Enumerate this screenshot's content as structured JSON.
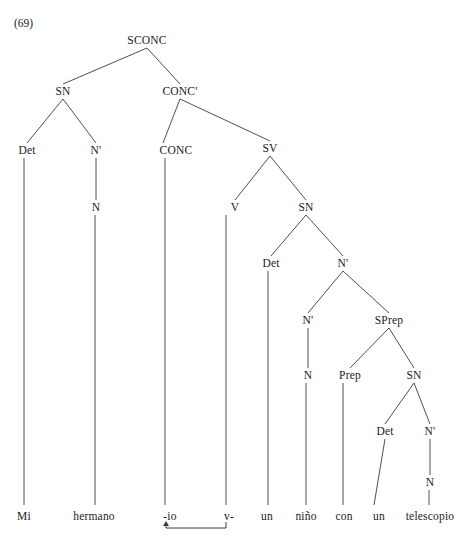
{
  "figure": {
    "example_number": "(69)",
    "type": "syntax-tree",
    "language": "Spanish",
    "sentence": "Mi hermano -io v- un niño con un telescopio",
    "line_color": "#3a3a4a",
    "text_color": "#1a1a1a",
    "background_color": "#ffffff",
    "width": 465,
    "height": 544
  },
  "nodes": [
    {
      "id": "sconc",
      "label": "SCONC",
      "x": 147,
      "y": 40
    },
    {
      "id": "sn1",
      "label": "SN",
      "x": 63,
      "y": 91
    },
    {
      "id": "conc_bar",
      "label": "CONC'",
      "x": 180,
      "y": 91
    },
    {
      "id": "det1",
      "label": "Det",
      "x": 27,
      "y": 150
    },
    {
      "id": "nbar1",
      "label": "N'",
      "x": 96,
      "y": 150
    },
    {
      "id": "conc",
      "label": "CONC",
      "x": 176,
      "y": 150
    },
    {
      "id": "sv",
      "label": "SV",
      "x": 270,
      "y": 148
    },
    {
      "id": "n1",
      "label": "N",
      "x": 96,
      "y": 207
    },
    {
      "id": "v",
      "label": "V",
      "x": 235,
      "y": 207
    },
    {
      "id": "sn2",
      "label": "SN",
      "x": 306,
      "y": 207
    },
    {
      "id": "det2",
      "label": "Det",
      "x": 271,
      "y": 263
    },
    {
      "id": "nbar2",
      "label": "N'",
      "x": 343,
      "y": 263
    },
    {
      "id": "nbar3",
      "label": "N'",
      "x": 308,
      "y": 320
    },
    {
      "id": "sprep",
      "label": "SPrep",
      "x": 389,
      "y": 320
    },
    {
      "id": "n2",
      "label": "N",
      "x": 308,
      "y": 375
    },
    {
      "id": "prep",
      "label": "Prep",
      "x": 350,
      "y": 375
    },
    {
      "id": "sn3",
      "label": "SN",
      "x": 414,
      "y": 375
    },
    {
      "id": "det3",
      "label": "Det",
      "x": 385,
      "y": 431
    },
    {
      "id": "nbar4",
      "label": "N'",
      "x": 430,
      "y": 431
    },
    {
      "id": "n3",
      "label": "N",
      "x": 430,
      "y": 482
    }
  ],
  "terminals": [
    {
      "id": "t_mi",
      "label": "Mi",
      "x": 24,
      "y": 516
    },
    {
      "id": "t_hermano",
      "label": "hermano",
      "x": 94,
      "y": 516
    },
    {
      "id": "t_io",
      "label": "-io",
      "x": 170,
      "y": 516
    },
    {
      "id": "t_v",
      "label": "v-",
      "x": 229,
      "y": 516
    },
    {
      "id": "t_un1",
      "label": "un",
      "x": 267,
      "y": 516
    },
    {
      "id": "t_nino",
      "label": "niño",
      "x": 306,
      "y": 516
    },
    {
      "id": "t_con",
      "label": "con",
      "x": 344,
      "y": 516
    },
    {
      "id": "t_un2",
      "label": "un",
      "x": 379,
      "y": 516
    },
    {
      "id": "t_telescopio",
      "label": "telescopio",
      "x": 430,
      "y": 516
    }
  ],
  "edges": [
    {
      "from": "sconc",
      "to": "sn1",
      "x1": 147,
      "y1": 48,
      "x2": 63,
      "y2": 84
    },
    {
      "from": "sconc",
      "to": "conc_bar",
      "x1": 147,
      "y1": 48,
      "x2": 180,
      "y2": 84
    },
    {
      "from": "sn1",
      "to": "det1",
      "x1": 63,
      "y1": 99,
      "x2": 27,
      "y2": 143
    },
    {
      "from": "sn1",
      "to": "nbar1",
      "x1": 63,
      "y1": 99,
      "x2": 96,
      "y2": 143
    },
    {
      "from": "conc_bar",
      "to": "conc",
      "x1": 180,
      "y1": 99,
      "x2": 163,
      "y2": 143
    },
    {
      "from": "conc_bar",
      "to": "sv",
      "x1": 180,
      "y1": 99,
      "x2": 270,
      "y2": 141
    },
    {
      "from": "nbar1",
      "to": "n1",
      "x1": 96,
      "y1": 158,
      "x2": 96,
      "y2": 200
    },
    {
      "from": "sv",
      "to": "v",
      "x1": 270,
      "y1": 156,
      "x2": 235,
      "y2": 200
    },
    {
      "from": "sv",
      "to": "sn2",
      "x1": 270,
      "y1": 156,
      "x2": 306,
      "y2": 200
    },
    {
      "from": "sn2",
      "to": "det2",
      "x1": 306,
      "y1": 215,
      "x2": 271,
      "y2": 256
    },
    {
      "from": "sn2",
      "to": "nbar2",
      "x1": 306,
      "y1": 215,
      "x2": 343,
      "y2": 256
    },
    {
      "from": "nbar2",
      "to": "nbar3",
      "x1": 343,
      "y1": 271,
      "x2": 308,
      "y2": 313
    },
    {
      "from": "nbar2",
      "to": "sprep",
      "x1": 343,
      "y1": 271,
      "x2": 389,
      "y2": 313
    },
    {
      "from": "nbar3",
      "to": "n2",
      "x1": 308,
      "y1": 328,
      "x2": 308,
      "y2": 368
    },
    {
      "from": "sprep",
      "to": "prep",
      "x1": 389,
      "y1": 328,
      "x2": 350,
      "y2": 368
    },
    {
      "from": "sprep",
      "to": "sn3",
      "x1": 389,
      "y1": 328,
      "x2": 414,
      "y2": 368
    },
    {
      "from": "sn3",
      "to": "det3",
      "x1": 414,
      "y1": 383,
      "x2": 385,
      "y2": 424
    },
    {
      "from": "sn3",
      "to": "nbar4",
      "x1": 414,
      "y1": 383,
      "x2": 430,
      "y2": 424
    },
    {
      "from": "nbar4",
      "to": "n3",
      "x1": 430,
      "y1": 439,
      "x2": 430,
      "y2": 475
    },
    {
      "from": "det1",
      "to": "t_mi",
      "x1": 24,
      "y1": 158,
      "x2": 24,
      "y2": 505
    },
    {
      "from": "n1",
      "to": "t_hermano",
      "x1": 95,
      "y1": 215,
      "x2": 95,
      "y2": 505
    },
    {
      "from": "conc",
      "to": "t_io",
      "x1": 165,
      "y1": 158,
      "x2": 165,
      "y2": 505
    },
    {
      "from": "v",
      "to": "t_v",
      "x1": 226,
      "y1": 215,
      "x2": 226,
      "y2": 505
    },
    {
      "from": "det2",
      "to": "t_un1",
      "x1": 268,
      "y1": 271,
      "x2": 268,
      "y2": 505
    },
    {
      "from": "n2",
      "to": "t_nino",
      "x1": 306,
      "y1": 383,
      "x2": 306,
      "y2": 505
    },
    {
      "from": "prep",
      "to": "t_con",
      "x1": 343,
      "y1": 383,
      "x2": 343,
      "y2": 505
    },
    {
      "from": "det3",
      "to": "t_un2",
      "x1": 385,
      "y1": 439,
      "x2": 374,
      "y2": 505
    },
    {
      "from": "n3",
      "to": "t_telescopio",
      "x1": 429,
      "y1": 490,
      "x2": 429,
      "y2": 505
    }
  ],
  "movement_arrow": {
    "label": "head-movement",
    "from_terminal": "t_v",
    "to_terminal": "t_io",
    "start_x": 226,
    "start_y": 522,
    "corner_y": 528,
    "end_x": 166,
    "head_y": 521
  }
}
